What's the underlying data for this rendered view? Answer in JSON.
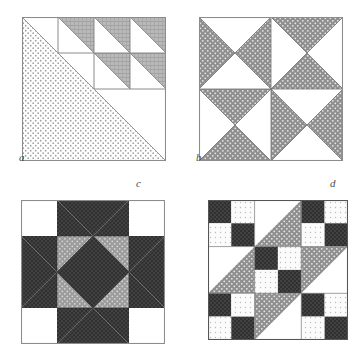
{
  "figure": {
    "kind": "quilt-block-diagram",
    "background_color": "#ffffff",
    "block_count": 4,
    "layout": "2x2 grid of square quilt blocks, each labelled with an italic letter"
  },
  "palette": {
    "white": "#ffffff",
    "light_dotted": "#f2f2f2",
    "medium_gray": "#9a9a9a",
    "medium_dotted_gray": "#8f8f8f",
    "dark_gray": "#3a3a3a",
    "outline": "#8c8c8c",
    "outline_dark": "#555555",
    "label_color": "#4a4a4a"
  },
  "blocks": [
    {
      "id": "a",
      "label": "a",
      "name": "half-square-triangle-staircase-block",
      "grid": "4x4",
      "x": 22,
      "y": 17,
      "size": 144,
      "description": "One large light-dotted half-square triangle filling the lower-left half of the block, plus three medium-gray half-square triangles stepping down the upper-right region.",
      "shapes": [
        {
          "kind": "big-triangle",
          "fill": "light_dotted",
          "points": "0,0 0,144 144,144"
        },
        {
          "kind": "hst",
          "fill": "medium_gray",
          "points": "36,0 72,0 72,36"
        },
        {
          "kind": "hst",
          "fill": "medium_gray",
          "points": "72,0 108,0 108,36"
        },
        {
          "kind": "hst",
          "fill": "medium_gray",
          "points": "108,0 144,0 144,36"
        },
        {
          "kind": "hst",
          "fill": "medium_gray",
          "points": "72,36 108,36 108,72"
        },
        {
          "kind": "hst",
          "fill": "medium_gray",
          "points": "108,36 144,36 144,72"
        }
      ],
      "inner_lines": [
        "36,0 36,36",
        "72,0 72,72",
        "108,0 108,72",
        "0,36 144,36",
        "36,72 144,72"
      ]
    },
    {
      "id": "b",
      "label": "b",
      "name": "hourglass-pinwheel-block",
      "grid": "2x2 of quarter-square-triangle units",
      "x": 199,
      "y": 17,
      "size": 144,
      "description": "Four quarter-square-triangle (hourglass) units. Top-left and bottom-right units have gray left/right triangles; top-right and bottom-left units have gray top/bottom triangles.",
      "units": [
        {
          "position": "top-left",
          "orientation": "horizontal-hourglass",
          "gray_sides": "left-right"
        },
        {
          "position": "top-right",
          "orientation": "vertical-hourglass",
          "gray_sides": "top-bottom"
        },
        {
          "position": "bottom-left",
          "orientation": "vertical-hourglass",
          "gray_sides": "top-bottom"
        },
        {
          "position": "bottom-right",
          "orientation": "horizontal-hourglass",
          "gray_sides": "left-right"
        }
      ]
    },
    {
      "id": "c",
      "label": "c",
      "name": "eight-pointed-star-block",
      "grid": "4x4",
      "x": 21,
      "y": 200,
      "size": 144,
      "description": "An eight-pointed star: dark star points radiating from a dark square center, with medium-gray quarter triangles filling the corners between the points, on a white background.",
      "shapes": [
        {
          "kind": "center-square",
          "fill": "dark_gray",
          "points": "36,36 108,36 108,108 36,108"
        },
        {
          "kind": "star-point-top",
          "fill": "dark_gray",
          "points": "36,0 108,0 72,36"
        },
        {
          "kind": "star-point-bottom",
          "fill": "dark_gray",
          "points": "36,144 108,144 72,108"
        },
        {
          "kind": "star-point-left",
          "fill": "dark_gray",
          "points": "0,36 0,108 36,72"
        },
        {
          "kind": "star-point-right",
          "fill": "dark_gray",
          "points": "144,36 144,108 108,72"
        },
        {
          "kind": "star-point-diag-tl",
          "fill": "dark_gray",
          "points": "36,0 72,36 36,36"
        },
        {
          "kind": "corner-fill-tl",
          "fill": "medium_gray",
          "points": "36,36 72,36 36,72"
        },
        {
          "kind": "corner-fill-tr",
          "fill": "medium_gray",
          "points": "108,36 72,36 108,72"
        },
        {
          "kind": "corner-fill-bl",
          "fill": "medium_gray",
          "points": "36,108 72,108 36,72"
        },
        {
          "kind": "corner-fill-br",
          "fill": "medium_gray",
          "points": "108,108 72,108 108,72"
        }
      ]
    },
    {
      "id": "d",
      "label": "d",
      "name": "jacobs-ladder-block",
      "grid": "3x3 of units",
      "x": 208,
      "y": 200,
      "size": 140,
      "description": "Jacob's Ladder: five four-patch units of dark and light-dotted squares on the two diagonals' off-band positions, and four half-square-triangle units whose medium-gray halves form a continuous diagonal band running from lower-left to upper-right.",
      "units": [
        {
          "position": "r0c0",
          "type": "four-patch",
          "tl": "dark",
          "tr": "light",
          "bl": "light",
          "br": "dark"
        },
        {
          "position": "r0c1",
          "type": "hst",
          "gray_half": "lower-right",
          "white_half": "upper-left"
        },
        {
          "position": "r0c2",
          "type": "four-patch",
          "tl": "dark",
          "tr": "light",
          "bl": "light",
          "br": "dark"
        },
        {
          "position": "r1c0",
          "type": "hst",
          "gray_half": "lower-right",
          "white_half": "upper-left"
        },
        {
          "position": "r1c1",
          "type": "four-patch",
          "tl": "dark",
          "tr": "light",
          "bl": "light",
          "br": "dark"
        },
        {
          "position": "r1c2",
          "type": "hst",
          "gray_half": "upper-left",
          "white_half": "lower-right"
        },
        {
          "position": "r2c0",
          "type": "four-patch",
          "tl": "dark",
          "tr": "light",
          "bl": "light",
          "br": "dark"
        },
        {
          "position": "r2c1",
          "type": "hst",
          "gray_half": "upper-left",
          "white_half": "lower-right"
        },
        {
          "position": "r2c2",
          "type": "four-patch",
          "tl": "dark",
          "tr": "light",
          "bl": "light",
          "br": "dark"
        }
      ]
    }
  ]
}
